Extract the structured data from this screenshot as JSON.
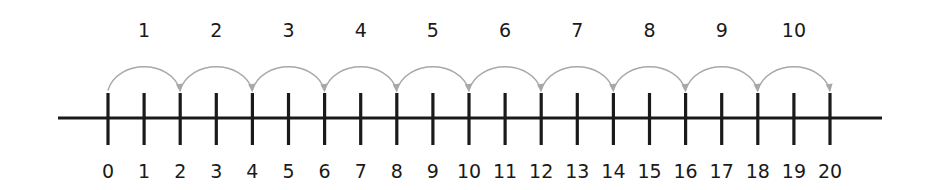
{
  "figure": {
    "type": "number-line-skip-counting",
    "background_color": "#ffffff",
    "line_color": "#1a1a1a",
    "arc_color": "#a8a8a8",
    "label_color": "#1a1a1a"
  },
  "chart_data": {
    "type": "line",
    "title": "",
    "subtitle": "",
    "xlabel": "",
    "ylabel": "",
    "grid": false,
    "legend": null,
    "axis": {
      "orientation": "horizontal",
      "min": 0,
      "max": 20,
      "step": 1,
      "tick_labels": [
        "0",
        "1",
        "2",
        "3",
        "4",
        "5",
        "6",
        "7",
        "8",
        "9",
        "10",
        "11",
        "12",
        "13",
        "14",
        "15",
        "16",
        "17",
        "18",
        "19",
        "20"
      ],
      "tick_values": [
        0,
        1,
        2,
        3,
        4,
        5,
        6,
        7,
        8,
        9,
        10,
        11,
        12,
        13,
        14,
        15,
        16,
        17,
        18,
        19,
        20
      ]
    },
    "hops": {
      "count": 10,
      "step_size": 2,
      "labels": [
        "1",
        "2",
        "3",
        "4",
        "5",
        "6",
        "7",
        "8",
        "9",
        "10"
      ],
      "from": [
        0,
        2,
        4,
        6,
        8,
        10,
        12,
        14,
        16,
        18
      ],
      "to": [
        2,
        4,
        6,
        8,
        10,
        12,
        14,
        16,
        18,
        20
      ],
      "direction": "right"
    }
  }
}
